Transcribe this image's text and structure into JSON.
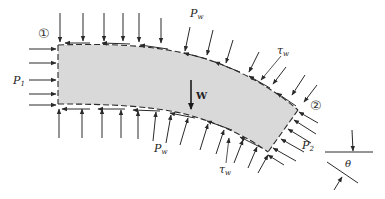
{
  "diagram": {
    "colors": {
      "fluid_fill": "#d9d9d9",
      "stroke": "#2a2a2a",
      "background": "#ffffff"
    },
    "sections": {
      "inlet": {
        "label": "①"
      },
      "outlet": {
        "label": "②"
      }
    },
    "labels": {
      "p1": {
        "main": "P",
        "sub": "1"
      },
      "p2": {
        "main": "P",
        "sub": "2"
      },
      "pw_top": {
        "main": "P",
        "sub": "w"
      },
      "pw_bottom": {
        "main": "P",
        "sub": "w"
      },
      "tau_top": {
        "main": "τ",
        "sub": "w"
      },
      "tau_bottom": {
        "main": "τ",
        "sub": "w"
      },
      "weight": "W",
      "theta": "θ"
    },
    "forces": [
      {
        "name": "inlet pressure",
        "symbol": "P1",
        "direction": "into inlet face (rightward)"
      },
      {
        "name": "outlet pressure",
        "symbol": "P2",
        "direction": "into outlet face"
      },
      {
        "name": "wall pressure",
        "symbol": "Pw",
        "direction": "normal to walls, inward"
      },
      {
        "name": "wall shear stress",
        "symbol": "τw",
        "direction": "tangent to walls, opposing flow"
      },
      {
        "name": "weight",
        "symbol": "W",
        "direction": "downward"
      }
    ]
  }
}
